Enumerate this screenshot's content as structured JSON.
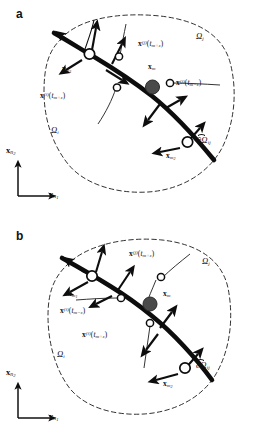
{
  "figure": {
    "panels": [
      {
        "letter": "a",
        "region_outer_label": "Ω",
        "labels": {
          "omega_j": {
            "base": "Ω",
            "sub": "j"
          },
          "omega_i": {
            "base": "Ω",
            "sub": "i"
          },
          "boundary": {
            "base": "∂Ω",
            "sub": "ij"
          },
          "x_m": {
            "base": "x",
            "sub": "m"
          },
          "x_m1": {
            "base": "x",
            "sub": "m",
            "subsub": "1"
          },
          "x_m2": {
            "base": "x",
            "sub": "m",
            "subsub": "2"
          },
          "traj_j_plus": {
            "base": "x",
            "sup": "(j)",
            "arg": "t",
            "argsub": "m+ε"
          },
          "traj_j_minus": {
            "base": "x",
            "sup": "(j)",
            "arg": "t",
            "argsub": "m−ε"
          },
          "traj_i_plus": {
            "base": "x",
            "sup": "(i)",
            "arg": "t",
            "argsub": "m+ε"
          }
        },
        "axes": {
          "vertical": {
            "base": "x",
            "sub": "n",
            "subsub": "2"
          },
          "horizontal": {
            "base": "x",
            "sub": "n",
            "subsub": "1"
          }
        }
      },
      {
        "letter": "b",
        "labels": {
          "omega_j": {
            "base": "Ω",
            "sub": "j"
          },
          "omega_i": {
            "base": "Ω",
            "sub": "i"
          },
          "boundary": {
            "base": "∂Ω",
            "sub": "ij"
          },
          "x_m": {
            "base": "x",
            "sub": "m"
          },
          "x_m1": {
            "base": "x",
            "sub": "m",
            "subsub": "1"
          },
          "x_m2": {
            "base": "x",
            "sub": "m",
            "subsub": "2"
          },
          "traj_j_plus": {
            "base": "x",
            "sup": "(j)",
            "arg": "t",
            "argsub": "m+ε"
          },
          "traj_i_minus": {
            "base": "x",
            "sup": "(i)",
            "arg": "t",
            "argsub": "m−ε"
          },
          "traj_i_plus": {
            "base": "x",
            "sup": "(i)",
            "arg": "t",
            "argsub": "m+ε"
          }
        },
        "axes": {
          "vertical": {
            "base": "x",
            "sub": "n",
            "subsub": "2"
          },
          "horizontal": {
            "base": "x",
            "sub": "n",
            "subsub": "1"
          }
        }
      }
    ],
    "colors": {
      "stroke": "#111111",
      "interface": "#0d0d0d",
      "node_filled": "#4a4a4a",
      "node_open_fill": "#ffffff",
      "background": "#ffffff",
      "dashed_boundary": "#1a1a1a"
    },
    "text": {
      "panel_a_letter": "a",
      "panel_b_letter": "b",
      "omega_j_a": "Ωj",
      "omega_i_a": "Ωi",
      "boundary_a": "∂Ωij",
      "x_m_a": "xm",
      "omega_j_b": "Ωj",
      "omega_i_b": "Ωi",
      "boundary_b": "∂Ωij",
      "x_m_b": "xm"
    }
  }
}
